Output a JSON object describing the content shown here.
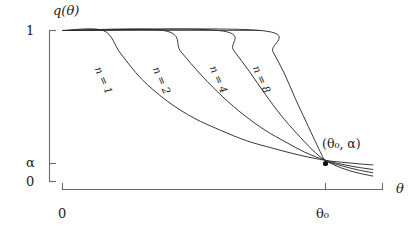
{
  "figure": {
    "background_color": "#ffffff",
    "axis_color": "#6a6a6a",
    "curve_color": "#2b2b2b",
    "y_axis_title": "q(θ)",
    "x_axis_title": "θ",
    "y_tick_labels": [
      "1",
      "α",
      "0"
    ],
    "x_tick_labels": [
      "0",
      "θ₀"
    ],
    "point_label": "(θ₀, α)",
    "curve_labels": [
      "n = 1",
      "n = 2",
      "n = 4",
      "n = 8"
    ]
  },
  "chart_data": {
    "type": "line",
    "title": "",
    "xlabel": "θ",
    "ylabel": "q(θ)",
    "grid": false,
    "legend": "inline-curve-labels",
    "xlim": [
      0,
      1.18
    ],
    "ylim": [
      0,
      1
    ],
    "xticks": [
      0,
      1
    ],
    "xticklabels": [
      "0",
      "θ₀"
    ],
    "yticks": [
      0,
      0.14,
      1
    ],
    "yticklabels": [
      "0",
      "α",
      "1"
    ],
    "annotations": [
      {
        "text": "(θ₀, α)",
        "x": 1.0,
        "y": 0.14,
        "marker": "dot",
        "description": "common crossing point of all power curves"
      }
    ],
    "series": [
      {
        "name": "n = 1",
        "label": "n = 1",
        "n": 1,
        "label_x": 0.135,
        "label_y": 0.79,
        "departs_flat_at_x": 0.155,
        "points_x": [
          0.0,
          0.155,
          0.22,
          0.3,
          0.4,
          0.5,
          0.6,
          0.7,
          0.8,
          0.9,
          1.0,
          1.06,
          1.12,
          1.18
        ],
        "points_y": [
          1.0,
          1.0,
          0.85,
          0.68,
          0.53,
          0.42,
          0.34,
          0.27,
          0.22,
          0.175,
          0.14,
          0.128,
          0.118,
          0.11
        ]
      },
      {
        "name": "n = 2",
        "label": "n = 2",
        "n": 2,
        "label_x": 0.355,
        "label_y": 0.79,
        "departs_flat_at_x": 0.385,
        "points_x": [
          0.0,
          0.385,
          0.45,
          0.53,
          0.61,
          0.69,
          0.77,
          0.85,
          0.92,
          1.0,
          1.06,
          1.12,
          1.18
        ],
        "points_y": [
          1.0,
          1.0,
          0.86,
          0.7,
          0.56,
          0.44,
          0.34,
          0.26,
          0.195,
          0.14,
          0.115,
          0.095,
          0.08
        ]
      },
      {
        "name": "n = 4",
        "label": "n = 4",
        "n": 4,
        "label_x": 0.572,
        "label_y": 0.8,
        "departs_flat_at_x": 0.595,
        "points_x": [
          0.0,
          0.595,
          0.65,
          0.71,
          0.77,
          0.83,
          0.89,
          0.95,
          1.0,
          1.06,
          1.12,
          1.18
        ],
        "points_y": [
          1.0,
          1.0,
          0.87,
          0.73,
          0.58,
          0.44,
          0.32,
          0.21,
          0.14,
          0.105,
          0.078,
          0.058
        ]
      },
      {
        "name": "n = 8",
        "label": "n = 8",
        "n": 8,
        "label_x": 0.735,
        "label_y": 0.8,
        "departs_flat_at_x": 0.755,
        "points_x": [
          0.0,
          0.755,
          0.8,
          0.845,
          0.885,
          0.925,
          0.96,
          0.985,
          1.0,
          1.06,
          1.12,
          1.18
        ],
        "points_y": [
          1.0,
          1.0,
          0.86,
          0.71,
          0.55,
          0.4,
          0.27,
          0.18,
          0.14,
          0.09,
          0.058,
          0.036
        ]
      }
    ]
  }
}
